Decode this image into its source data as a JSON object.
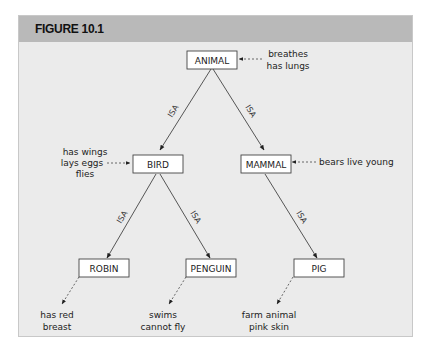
{
  "figure": {
    "title": "FIGURE 10.1"
  },
  "nodes": {
    "animal": "ANIMAL",
    "bird": "BIRD",
    "mammal": "MAMMAL",
    "robin": "ROBIN",
    "penguin": "PENGUIN",
    "pig": "PIG"
  },
  "properties": {
    "animal": [
      "breathes",
      "has lungs"
    ],
    "bird": [
      "has wings",
      "lays eggs",
      "flies"
    ],
    "mammal": [
      "bears live young"
    ],
    "robin": [
      "has red",
      "breast"
    ],
    "penguin": [
      "swims",
      "cannot fly"
    ],
    "pig": [
      "farm animal",
      "pink skin"
    ]
  },
  "edges": {
    "isa_label": "ISA",
    "list": [
      {
        "from": "ANIMAL",
        "to": "BIRD",
        "label": "ISA"
      },
      {
        "from": "ANIMAL",
        "to": "MAMMAL",
        "label": "ISA"
      },
      {
        "from": "BIRD",
        "to": "ROBIN",
        "label": "ISA"
      },
      {
        "from": "BIRD",
        "to": "PENGUIN",
        "label": "ISA"
      },
      {
        "from": "MAMMAL",
        "to": "PIG",
        "label": "ISA"
      }
    ]
  }
}
